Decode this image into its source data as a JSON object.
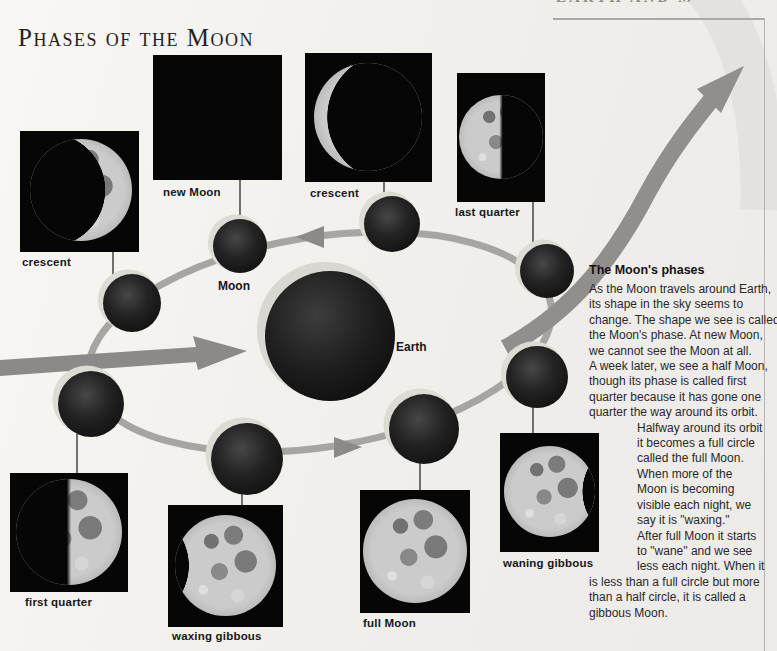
{
  "page": {
    "title": "Phases of the Moon",
    "header_fragment": "EARTH AND MOON",
    "background_color": "#f0efec"
  },
  "diagram": {
    "earth_label": "Earth",
    "moon_label": "Moon",
    "orbit_color": "#a6a5a2",
    "arrow_color": "#8b8a88",
    "sphere_rim_color": "#dcdbd4",
    "icons": [
      "orbit-ellipse",
      "orbit-direction-arrowheads",
      "sunlight-arrow",
      "page-corner-swoosh-arrow"
    ]
  },
  "photos": [
    {
      "label": "crescent",
      "phase": "crescent-lit-right"
    },
    {
      "label": "new Moon",
      "phase": "new-black"
    },
    {
      "label": "crescent",
      "phase": "crescent-lit-left"
    },
    {
      "label": "last quarter",
      "phase": "half-lit-left"
    },
    {
      "label": "first quarter",
      "phase": "half-lit-right"
    },
    {
      "label": "waxing gibbous",
      "phase": "gibbous-shadow-left"
    },
    {
      "label": "full Moon",
      "phase": "full"
    },
    {
      "label": "waning gibbous",
      "phase": "gibbous-shadow-right"
    }
  ],
  "sidebar": {
    "heading": "The Moon's phases",
    "lines": [
      {
        "text": "As the Moon travels around Earth,",
        "indent": false
      },
      {
        "text": "its shape in the sky seems to",
        "indent": false
      },
      {
        "text": "change. The shape we see is called",
        "indent": false
      },
      {
        "text": "the Moon's phase. At new Moon,",
        "indent": false
      },
      {
        "text": "we cannot see the Moon at all.",
        "indent": false
      },
      {
        "text": "A week later, we see a half Moon,",
        "indent": false
      },
      {
        "text": "though its phase is called first",
        "indent": false
      },
      {
        "text": "quarter because it has gone one",
        "indent": false
      },
      {
        "text": "quarter the way around its orbit.",
        "indent": false
      },
      {
        "text": "Halfway around its orbit",
        "indent": true
      },
      {
        "text": "it becomes a full circle",
        "indent": true
      },
      {
        "text": "called the full Moon.",
        "indent": true
      },
      {
        "text": "When more of the",
        "indent": true
      },
      {
        "text": "Moon is becoming",
        "indent": true
      },
      {
        "text": "visible each night, we",
        "indent": true
      },
      {
        "text": "say it is \"waxing.\"",
        "indent": true
      },
      {
        "text": "After full Moon it starts",
        "indent": true
      },
      {
        "text": "to \"wane\" and we see",
        "indent": true
      },
      {
        "text": "less each night. When it",
        "indent": true
      },
      {
        "text": "is less than a full circle but more",
        "indent": false
      },
      {
        "text": "than a half circle, it is called a",
        "indent": false
      },
      {
        "text": "gibbous Moon.",
        "indent": false
      }
    ]
  }
}
